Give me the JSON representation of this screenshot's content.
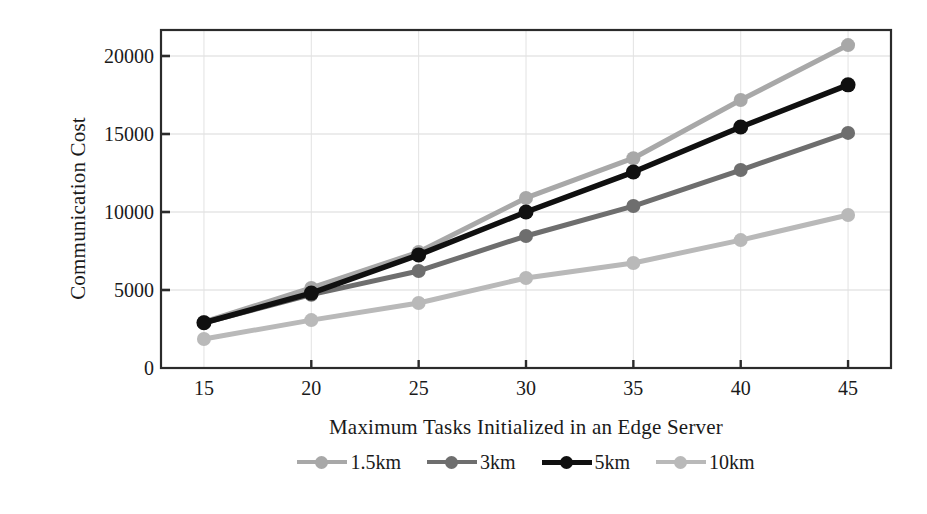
{
  "chart_data": {
    "type": "line",
    "title": "",
    "xlabel": "Maximum Tasks Initialized in an Edge Server",
    "ylabel": "Communication Cost",
    "x": [
      15,
      20,
      25,
      30,
      35,
      40,
      45
    ],
    "xticklabels": [
      "15",
      "20",
      "25",
      "30",
      "35",
      "40",
      "45"
    ],
    "yticklabels": [
      "0",
      "5000",
      "10000",
      "15000",
      "20000"
    ],
    "yticks": [
      0,
      5000,
      10000,
      15000,
      20000
    ],
    "xlim": [
      13,
      47
    ],
    "ylim": [
      0,
      22000
    ],
    "grid": "horizontal-and-vertical-light",
    "legend_position": "bottom-center",
    "series": [
      {
        "name": "1.5km",
        "color": "#a8a8a8",
        "values": [
          2950,
          5130,
          7430,
          10900,
          13450,
          17180,
          20700
        ]
      },
      {
        "name": "3km",
        "color": "#6e6e6e",
        "values": [
          2900,
          4700,
          6220,
          8460,
          10380,
          12690,
          15070
        ]
      },
      {
        "name": "5km",
        "color": "#101010",
        "values": [
          2900,
          4800,
          7250,
          10000,
          12560,
          15450,
          18150
        ]
      },
      {
        "name": "10km",
        "color": "#b9b9b9",
        "values": [
          1860,
          3070,
          4170,
          5770,
          6730,
          8200,
          9810
        ]
      }
    ]
  },
  "axes": {
    "plot_left": 161,
    "plot_right": 891,
    "plot_top": 30,
    "plot_bottom": 368
  }
}
